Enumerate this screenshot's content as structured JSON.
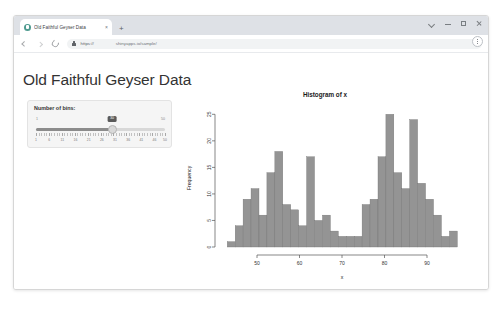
{
  "browser": {
    "tab": {
      "title": "Old Faithful Geyser Data",
      "favicon_name": "shiny-favicon",
      "close_label": "×"
    },
    "new_tab_label": "+",
    "window_controls": [
      "chevron-down",
      "minimize",
      "maximize",
      "close"
    ],
    "toolbar": {
      "back_label": "",
      "forward_label": "",
      "reload_label": "",
      "url_scheme": "https://",
      "url_host": "shinyapps.io/sample/",
      "menu_label": ""
    }
  },
  "page": {
    "title": "Old Faithful Geyser Data",
    "controls": {
      "slider_label": "Number of bins:",
      "slider_min_label": "1",
      "slider_max_label": "50",
      "slider_value": "30",
      "slider_min": 1,
      "slider_max": 50,
      "tick_labels": [
        "1",
        "6",
        "11",
        "16",
        "21",
        "26",
        "31",
        "36",
        "41",
        "46",
        "50"
      ]
    }
  },
  "chart_data": {
    "type": "bar",
    "title": "Histogram of x",
    "xlabel": "x",
    "ylabel": "Frequency",
    "xlim": [
      42,
      98
    ],
    "ylim": [
      0,
      26
    ],
    "xticks": [
      50,
      60,
      70,
      80,
      90
    ],
    "yticks": [
      0,
      5,
      10,
      15,
      20,
      25
    ],
    "grid": false,
    "legend": "none",
    "bin_width": 1.867,
    "bin_starts": [
      43.0,
      44.87,
      46.73,
      48.6,
      50.47,
      52.33,
      54.2,
      56.07,
      57.93,
      59.8,
      61.67,
      63.53,
      65.4,
      67.27,
      69.13,
      71.0,
      72.87,
      74.73,
      76.6,
      78.47,
      80.33,
      82.2,
      84.07,
      85.93,
      87.8,
      89.67,
      91.53,
      93.4,
      95.27
    ],
    "categories": [
      "43",
      "45",
      "47",
      "49",
      "50",
      "52",
      "54",
      "56",
      "58",
      "60",
      "62",
      "64",
      "65",
      "67",
      "69",
      "71",
      "73",
      "75",
      "77",
      "78",
      "80",
      "82",
      "84",
      "86",
      "88",
      "90",
      "92",
      "93",
      "95"
    ],
    "values": [
      1,
      4,
      9,
      11,
      6,
      14,
      18,
      8,
      7,
      4,
      17,
      5,
      6,
      3,
      2,
      2,
      2,
      8,
      9,
      17,
      25,
      14,
      11,
      24,
      12,
      9,
      6,
      2,
      3
    ],
    "color": "#949494"
  }
}
